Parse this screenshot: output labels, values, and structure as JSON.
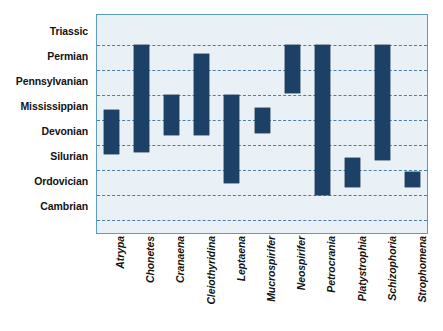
{
  "chart_data": {
    "type": "bar",
    "orientation": "vertical-range",
    "title": "",
    "subtitle": "",
    "xlabel": "",
    "ylabel": "",
    "legend": null,
    "grid": true,
    "background_color": "#e9f1f6",
    "bar_color": "#1d4067",
    "gridline_color": "#4a7fa5",
    "border_color": "#5b9cc4",
    "y_axis": {
      "type": "categorical-ordinal-periods",
      "order": "oldest-at-bottom",
      "tick_labels": [
        "Triassic",
        "Permian",
        "Pennsylvanian",
        "Mississippian",
        "Devonian",
        "Silurian",
        "Ordovician",
        "Cambrian"
      ],
      "ylim": [
        0,
        8
      ]
    },
    "categories": [
      "Atrypa",
      "Chonetes",
      "Cranaena",
      "Cleiothyridina",
      "Leptaena",
      "Mucrospirifer",
      "Neospirifer",
      "Petrocrania",
      "Platystrophia",
      "Schizophoria",
      "Strophomena"
    ],
    "series": [
      {
        "name": "Geologic range",
        "units": "period boundaries",
        "ranges": [
          {
            "category": "Atrypa",
            "top_period": "Devonian",
            "bottom_period": "Silurian",
            "y_top": 4.38,
            "y_bottom": 2.62
          },
          {
            "category": "Chonetes",
            "top_period": "Triassic",
            "bottom_period": "Silurian",
            "y_top": 7.0,
            "y_bottom": 2.69
          },
          {
            "category": "Cranaena",
            "top_period": "Mississippian",
            "bottom_period": "Devonian",
            "y_top": 5.0,
            "y_bottom": 3.38
          },
          {
            "category": "Cleiothyridina",
            "top_period": "Permian",
            "bottom_period": "Devonian",
            "y_top": 6.62,
            "y_bottom": 3.38
          },
          {
            "category": "Leptaena",
            "top_period": "Mississippian",
            "bottom_period": "Ordovician",
            "y_top": 5.0,
            "y_bottom": 1.46
          },
          {
            "category": "Mucrospirifer",
            "top_period": "Devonian",
            "bottom_period": "Devonian",
            "y_top": 4.46,
            "y_bottom": 3.46
          },
          {
            "category": "Neospirifer",
            "top_period": "Triassic",
            "bottom_period": "Pennsylvanian",
            "y_top": 7.0,
            "y_bottom": 5.05
          },
          {
            "category": "Petrocrania",
            "top_period": "Triassic",
            "bottom_period": "Cambrian",
            "y_top": 7.0,
            "y_bottom": 1.0
          },
          {
            "category": "Platystrophia",
            "top_period": "Silurian",
            "bottom_period": "Ordovician",
            "y_top": 2.46,
            "y_bottom": 1.31
          },
          {
            "category": "Schizophoria",
            "top_period": "Triassic",
            "bottom_period": "Silurian",
            "y_top": 7.0,
            "y_bottom": 2.38
          },
          {
            "category": "Strophomena",
            "top_period": "Ordovician",
            "bottom_period": "Ordovician",
            "y_top": 1.92,
            "y_bottom": 1.31
          }
        ]
      }
    ]
  }
}
